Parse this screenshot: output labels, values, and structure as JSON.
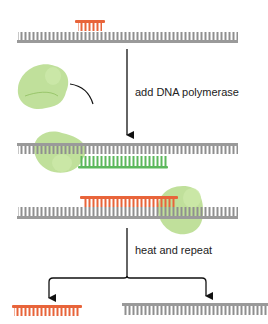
{
  "diagram": {
    "steps": [
      {
        "label": "add DNA polymerase"
      },
      {
        "label": "heat and repeat"
      }
    ],
    "colors": {
      "template_strand": "#8f8f8f",
      "primer": "#e8643a",
      "new_strand": "#5cb85c",
      "polymerase": "#a9d47a",
      "arrow": "#111111"
    },
    "elements": [
      {
        "name": "template-strand",
        "stage": 1
      },
      {
        "name": "primer",
        "stage": 1
      },
      {
        "name": "dna-polymerase",
        "stage": 1
      },
      {
        "name": "template-strand",
        "stage": 2
      },
      {
        "name": "new-strand-green",
        "stage": 2
      },
      {
        "name": "template-strand",
        "stage": 3
      },
      {
        "name": "new-strand-orange",
        "stage": 3
      },
      {
        "name": "product-orange",
        "stage": 4
      },
      {
        "name": "product-gray",
        "stage": 4
      }
    ]
  }
}
